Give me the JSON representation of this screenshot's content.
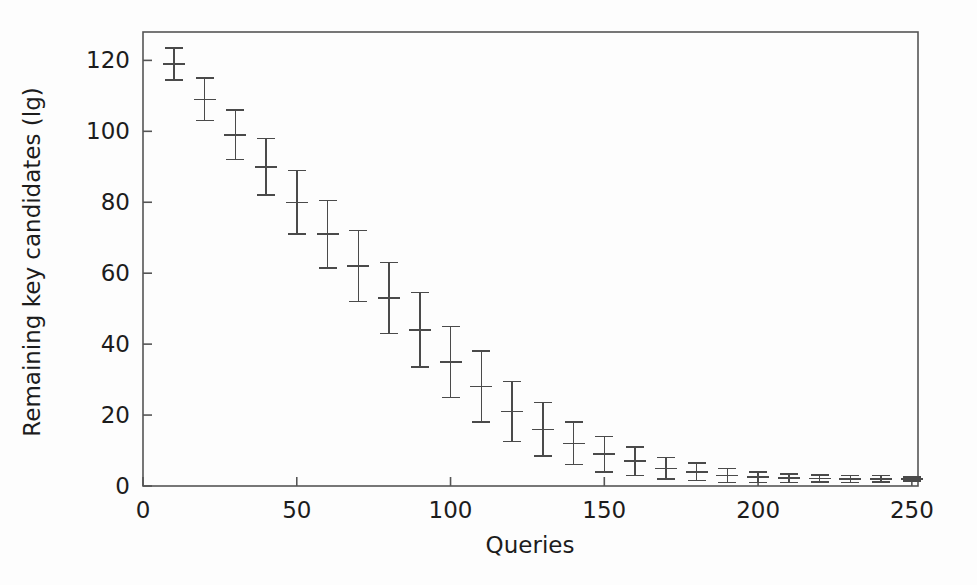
{
  "chart_data": {
    "type": "scatter",
    "title": "",
    "xlabel": "Queries",
    "ylabel": "Remaining key candidates (lg)",
    "xlim": [
      0,
      252
    ],
    "ylim": [
      0,
      128
    ],
    "xticks": [
      0,
      50,
      100,
      150,
      200,
      250
    ],
    "yticks": [
      0,
      20,
      40,
      60,
      80,
      100,
      120
    ],
    "xtick_labels": [
      "0",
      "50",
      "100",
      "150",
      "200",
      "250"
    ],
    "ytick_labels": [
      "0",
      "20",
      "40",
      "60",
      "80",
      "100",
      "120"
    ],
    "grid": false,
    "legend": null,
    "marker": "horizontal-dash with vertical error bar and caps",
    "series": [
      {
        "name": "Remaining key candidates",
        "x": [
          10,
          20,
          30,
          40,
          50,
          60,
          70,
          80,
          90,
          100,
          110,
          120,
          130,
          140,
          150,
          160,
          170,
          180,
          190,
          200,
          210,
          220,
          230,
          240,
          250
        ],
        "values": [
          119,
          109,
          99,
          90,
          80,
          71,
          62,
          53,
          44,
          35,
          28,
          21,
          16,
          12,
          9,
          7,
          5,
          4,
          3,
          2.5,
          2.2,
          2.1,
          2.0,
          2.0,
          2.0
        ],
        "err_low": [
          4.5,
          6,
          7,
          8,
          9,
          9.5,
          10,
          10,
          10.5,
          10,
          10,
          8.5,
          7.5,
          6,
          5,
          4,
          3,
          2.5,
          2,
          1.5,
          1.2,
          1.0,
          1.0,
          0.9,
          0.6
        ],
        "err_high": [
          4.5,
          6,
          7,
          8,
          9,
          9.5,
          10,
          10,
          10.5,
          10,
          10,
          8.5,
          7.5,
          6,
          5,
          4,
          3,
          2.5,
          2,
          1.5,
          1.2,
          1.0,
          1.0,
          0.9,
          0.6
        ]
      }
    ]
  },
  "colors": {
    "line": "#4a4a4a",
    "axis": "#555555",
    "text": "#1c1c1c",
    "background": "#fdfdfd"
  }
}
